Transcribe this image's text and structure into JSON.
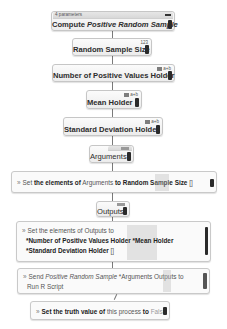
{
  "process": {
    "params_label": "4 parameters",
    "title_prefix": "Compute ",
    "title_italic": "Positive Random Sample"
  },
  "blocks": [
    {
      "label": "Random Sample Size",
      "badge": "123"
    },
    {
      "label": "Number of Positive Values Holder",
      "badge": "a+b"
    },
    {
      "label": "Mean Holder",
      "badge": "a+b"
    },
    {
      "label": "Standard Deviation Holder",
      "badge": "a+b"
    },
    {
      "label": "Arguments",
      "badge": "list"
    },
    {
      "label": "Outputs",
      "badge": "list"
    }
  ],
  "statements": {
    "set_arguments": {
      "set": "Set",
      "mid": "the elements of",
      "target": "Arguments",
      "to": "to",
      "value": "Random Sample Size",
      "suffix": "[]"
    },
    "set_outputs": {
      "set": "Set",
      "mid": "the elements of",
      "target": "Outputs",
      "to": "to",
      "item1": "*Number of Positive Values Holder",
      "item2": "*Mean Holder",
      "item3": "*Standard Deviation Holder",
      "suffix": "[]"
    },
    "send": {
      "send": "Send",
      "italic": "Positive Random Sample",
      "args": "*Arguments",
      "outputs": "Outputs",
      "to": "to",
      "line2": "Run R Script"
    },
    "set_truth": {
      "set": "Set",
      "mid": "the truth value",
      "of": "of",
      "this": "this process",
      "to": "to",
      "value": "False"
    }
  },
  "colors": {
    "block_bg": "#f2f2f2",
    "block_border": "#c6c6c6",
    "handle": "#2a2a2a",
    "connector": "#7a7a7a"
  }
}
